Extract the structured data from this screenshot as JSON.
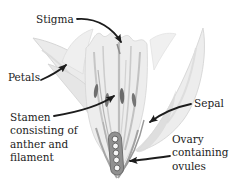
{
  "figure": {
    "background_color": "#ffffff",
    "ink_color": "#1c1c1c",
    "petal_color": "#ececec",
    "petal_shade_color": "#c9c9c9",
    "anther_color": "#6e6e6e",
    "ovule_color": "#f6f6f6",
    "labels": {
      "stigma": {
        "text": "Stigma"
      },
      "petals": {
        "text": "Petals"
      },
      "stamen": {
        "lines": [
          "Stamen",
          "consisting of",
          "anther and",
          "filament"
        ]
      },
      "sepal": {
        "text": "Sepal"
      },
      "ovary": {
        "lines": [
          "Ovary",
          "containing",
          "ovules"
        ]
      }
    }
  }
}
